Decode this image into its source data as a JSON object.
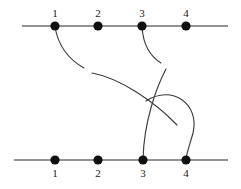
{
  "figure": {
    "title": "",
    "kind": "tangle-diagram",
    "width": 241,
    "height": 189,
    "background_color": "#ffffff",
    "strand_color": "#3c3c3c",
    "axis_color": "#6e6e6e",
    "node_color": "#101010",
    "label_color": "#1a1a1a"
  },
  "axes": {
    "top": {
      "y": 26,
      "x_start": 22,
      "x_end": 228
    },
    "bottom": {
      "y": 160,
      "x_start": 14,
      "x_end": 228
    }
  },
  "top_nodes": [
    {
      "label": "1",
      "x": 55,
      "y": 26,
      "label_x": 55,
      "label_y": 17
    },
    {
      "label": "2",
      "x": 98,
      "y": 26,
      "label_x": 98,
      "label_y": 17
    },
    {
      "label": "3",
      "x": 142,
      "y": 26,
      "label_x": 142,
      "label_y": 17
    },
    {
      "label": "4",
      "x": 186,
      "y": 26,
      "label_x": 186,
      "label_y": 17
    }
  ],
  "bottom_nodes": [
    {
      "label": "1",
      "x": 55,
      "y": 160,
      "label_x": 55,
      "label_y": 177
    },
    {
      "label": "2",
      "x": 98,
      "y": 160,
      "label_x": 98,
      "label_y": 177
    },
    {
      "label": "3",
      "x": 143,
      "y": 160,
      "label_x": 143,
      "label_y": 177
    },
    {
      "label": "4",
      "x": 186,
      "y": 160,
      "label_x": 186,
      "label_y": 177
    }
  ],
  "strands": [
    {
      "name": "arc-top1-hook",
      "from": "top-node-1",
      "to": "break-upper-left",
      "path": "M 55 27 C 58 44, 66 58, 84 68"
    },
    {
      "name": "arc-long-upper-left-to-lower-right",
      "from": "break-upper-left",
      "to": "break-lower-right",
      "path": "M 92 73 C 120 78, 155 102, 177 125"
    },
    {
      "name": "strand-top2-to-bottom1",
      "from": "top-node-2",
      "to": "bottom-node-1",
      "path": "M 98 27 C 94 60, 74 118, 56 159"
    },
    {
      "name": "arc-top3-hook",
      "from": "top-node-3",
      "to": "break-mid-right",
      "path": "M 142 27 C 143 42, 148 55, 161 63"
    },
    {
      "name": "arc-midright-to-bottom3",
      "from": "break-mid-right",
      "to": "bottom-node-3",
      "path": "M 166 69 C 156 88, 144 122, 143 159"
    },
    {
      "name": "strand-top4-to-break-lower",
      "from": "top-node-4",
      "to": "break-lower-center",
      "path": "M 186 27 C 182 45, 172 58, 162 70"
    },
    {
      "name": "strand-bottom2-to-break-center",
      "from": "bottom-node-2",
      "to": "break-center",
      "path": "M 98 159 C 112 140, 128 120, 139 107"
    },
    {
      "name": "arc-right-bulge-to-bottom4",
      "from": "break-center",
      "to": "bottom-node-4",
      "path": "M 146 101 C 172 84, 200 104, 193 133 C 190 144, 187 152, 186 159"
    }
  ]
}
